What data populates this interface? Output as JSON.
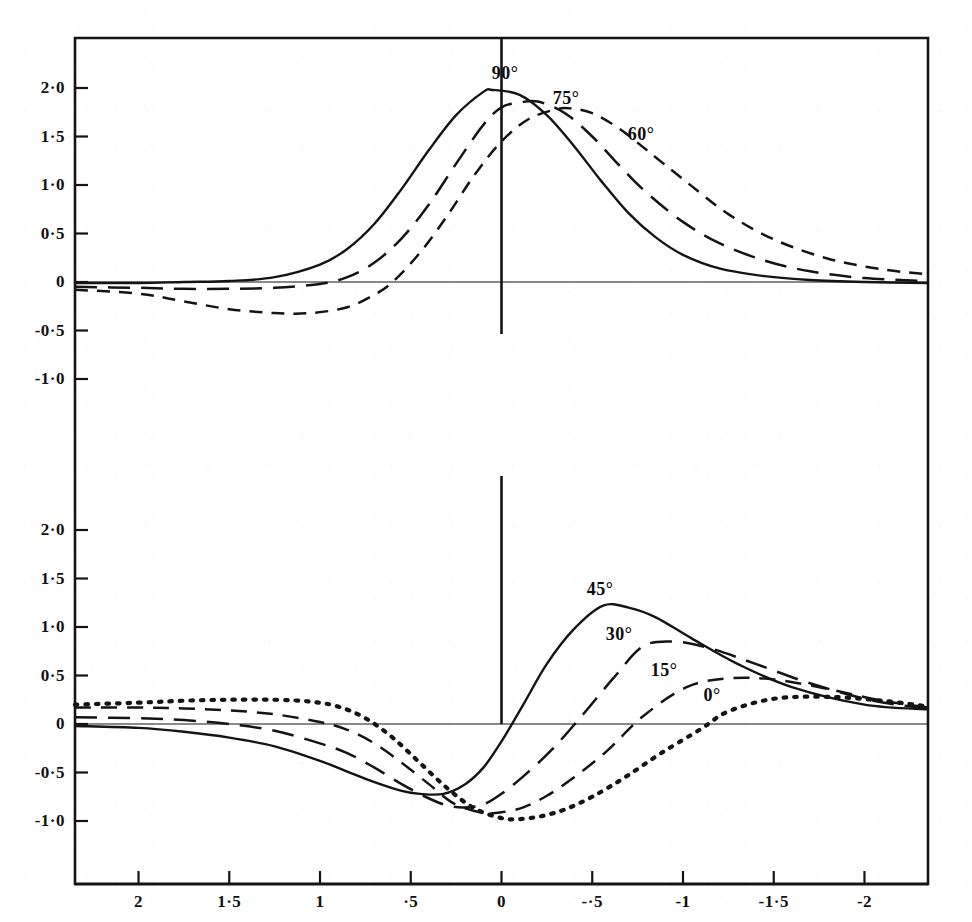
{
  "chart_data": {
    "type": "line",
    "title": "",
    "subtitle": "",
    "xlabel": "",
    "ylabel": "",
    "xlim": [
      2.35,
      -2.35
    ],
    "x_axis_reversed": true,
    "grid": false,
    "legend_position": "inline-curve-labels",
    "panels": [
      {
        "name": "upper-panel",
        "ylim": [
          -1.4,
          2.35
        ],
        "ytick_values": [
          2.0,
          1.5,
          1.0,
          0.5,
          0,
          -0.5,
          -1.0
        ],
        "ytick_labels": [
          "2·0",
          "1·5",
          "1·0",
          "0·5",
          "0",
          "-0·5",
          "-1·0"
        ],
        "zero_line": true,
        "vertical_axis_at_x": 0,
        "series": [
          {
            "name": "90°",
            "label": "90°",
            "style": "solid",
            "peak_x": 0.05,
            "peak_y": 1.98,
            "x": [
              2.35,
              2.0,
              1.75,
              1.5,
              1.25,
              1.0,
              0.85,
              0.7,
              0.55,
              0.4,
              0.25,
              0.1,
              0.05,
              -0.1,
              -0.25,
              -0.4,
              -0.55,
              -0.7,
              -0.85,
              -1.0,
              -1.2,
              -1.45,
              -1.7,
              -2.0,
              -2.35
            ],
            "y": [
              -0.01,
              -0.01,
              0.0,
              0.01,
              0.05,
              0.18,
              0.34,
              0.6,
              0.96,
              1.36,
              1.72,
              1.96,
              1.98,
              1.93,
              1.72,
              1.4,
              1.04,
              0.71,
              0.46,
              0.28,
              0.14,
              0.06,
              0.02,
              0.0,
              -0.01
            ]
          },
          {
            "name": "75°",
            "label": "75°",
            "style": "long-dash",
            "peak_x": -0.2,
            "peak_y": 1.86,
            "x": [
              2.35,
              2.0,
              1.75,
              1.5,
              1.25,
              1.0,
              0.85,
              0.7,
              0.55,
              0.4,
              0.25,
              0.1,
              0.0,
              -0.1,
              -0.2,
              -0.35,
              -0.5,
              -0.65,
              -0.8,
              -1.0,
              -1.2,
              -1.45,
              -1.7,
              -2.0,
              -2.35
            ],
            "y": [
              -0.05,
              -0.06,
              -0.07,
              -0.07,
              -0.06,
              -0.02,
              0.05,
              0.2,
              0.45,
              0.8,
              1.22,
              1.62,
              1.8,
              1.85,
              1.86,
              1.74,
              1.5,
              1.2,
              0.92,
              0.62,
              0.4,
              0.22,
              0.11,
              0.04,
              0.01
            ]
          },
          {
            "name": "60°",
            "label": "60°",
            "style": "short-dash",
            "peak_x": -0.38,
            "peak_y": 1.79,
            "x": [
              2.35,
              2.0,
              1.75,
              1.5,
              1.25,
              1.05,
              0.85,
              0.7,
              0.6,
              0.45,
              0.3,
              0.15,
              0.0,
              -0.15,
              -0.3,
              -0.38,
              -0.5,
              -0.65,
              -0.8,
              -1.0,
              -1.25,
              -1.5,
              -1.8,
              -2.1,
              -2.35
            ],
            "y": [
              -0.08,
              -0.12,
              -0.2,
              -0.28,
              -0.32,
              -0.32,
              -0.26,
              -0.13,
              0.0,
              0.3,
              0.68,
              1.1,
              1.45,
              1.68,
              1.78,
              1.79,
              1.74,
              1.58,
              1.36,
              1.06,
              0.7,
              0.44,
              0.24,
              0.13,
              0.08
            ]
          }
        ]
      },
      {
        "name": "lower-panel",
        "ylim": [
          -1.4,
          2.35
        ],
        "ytick_values": [
          2.0,
          1.5,
          1.0,
          0.5,
          0,
          -0.5,
          -1.0
        ],
        "ytick_labels": [
          "2·0",
          "1·5",
          "1·0",
          "0·5",
          "0",
          "-0·5",
          "-1·0"
        ],
        "zero_line": true,
        "vertical_axis_at_x": 0,
        "series": [
          {
            "name": "45°",
            "label": "45°",
            "style": "solid",
            "peak_x": -0.56,
            "peak_y": 1.22,
            "min_x": 0.32,
            "min_y": -0.72,
            "x": [
              2.35,
              2.0,
              1.75,
              1.5,
              1.25,
              1.0,
              0.85,
              0.7,
              0.55,
              0.45,
              0.32,
              0.2,
              0.1,
              0.0,
              -0.12,
              -0.25,
              -0.4,
              -0.56,
              -0.7,
              -0.85,
              -1.05,
              -1.3,
              -1.6,
              -2.0,
              -2.35
            ],
            "y": [
              -0.02,
              -0.04,
              -0.08,
              -0.14,
              -0.23,
              -0.38,
              -0.49,
              -0.6,
              -0.69,
              -0.72,
              -0.72,
              -0.62,
              -0.45,
              -0.18,
              0.2,
              0.62,
              0.98,
              1.22,
              1.2,
              1.1,
              0.88,
              0.62,
              0.38,
              0.2,
              0.15
            ]
          },
          {
            "name": "30°",
            "label": "30°",
            "style": "long-dash",
            "peak_x": -0.78,
            "peak_y": 0.85,
            "min_x": 0.2,
            "min_y": -0.86,
            "x": [
              2.35,
              2.0,
              1.75,
              1.5,
              1.25,
              1.0,
              0.85,
              0.7,
              0.55,
              0.42,
              0.3,
              0.2,
              0.1,
              0.0,
              -0.12,
              -0.28,
              -0.45,
              -0.62,
              -0.78,
              -0.95,
              -1.15,
              -1.4,
              -1.7,
              -2.05,
              -2.35
            ],
            "y": [
              0.07,
              0.06,
              0.04,
              0.0,
              -0.07,
              -0.2,
              -0.3,
              -0.45,
              -0.62,
              -0.75,
              -0.84,
              -0.86,
              -0.83,
              -0.72,
              -0.54,
              -0.26,
              0.1,
              0.48,
              0.8,
              0.85,
              0.78,
              0.62,
              0.42,
              0.24,
              0.16
            ]
          },
          {
            "name": "15°",
            "label": "15°",
            "style": "dashed",
            "peak_x": -1.02,
            "peak_y": 0.47,
            "min_x": 0.08,
            "min_y": -0.92,
            "x": [
              2.35,
              2.0,
              1.75,
              1.5,
              1.25,
              1.0,
              0.85,
              0.7,
              0.55,
              0.4,
              0.28,
              0.18,
              0.08,
              0.0,
              -0.12,
              -0.25,
              -0.4,
              -0.58,
              -0.78,
              -1.02,
              -1.25,
              -1.5,
              -1.8,
              -2.1,
              -2.35
            ],
            "y": [
              0.17,
              0.17,
              0.16,
              0.14,
              0.1,
              0.02,
              -0.06,
              -0.2,
              -0.4,
              -0.62,
              -0.8,
              -0.88,
              -0.92,
              -0.91,
              -0.86,
              -0.74,
              -0.55,
              -0.28,
              0.08,
              0.38,
              0.47,
              0.46,
              0.36,
              0.24,
              0.17
            ]
          },
          {
            "name": "0°",
            "label": "0°",
            "style": "dotted",
            "peak_x": -1.25,
            "peak_y": 0.28,
            "min_x": -0.1,
            "min_y": -0.98,
            "x": [
              2.35,
              2.0,
              1.75,
              1.5,
              1.25,
              1.05,
              0.9,
              0.75,
              0.6,
              0.45,
              0.3,
              0.15,
              0.0,
              -0.1,
              -0.22,
              -0.35,
              -0.5,
              -0.68,
              -0.88,
              -1.1,
              -1.25,
              -1.5,
              -1.8,
              -2.1,
              -2.35
            ],
            "y": [
              0.2,
              0.22,
              0.24,
              0.25,
              0.25,
              0.23,
              0.18,
              0.06,
              -0.14,
              -0.4,
              -0.66,
              -0.87,
              -0.97,
              -0.98,
              -0.95,
              -0.88,
              -0.75,
              -0.55,
              -0.3,
              -0.05,
              0.13,
              0.26,
              0.28,
              0.24,
              0.18
            ]
          }
        ]
      }
    ],
    "xtick_values": [
      2,
      1.5,
      1,
      0.5,
      0,
      -0.5,
      -1,
      -1.5,
      -2
    ],
    "xtick_labels": [
      "2",
      "1·5",
      "1",
      "·5",
      "0",
      "-·5",
      "-1",
      "-1·5",
      "-2"
    ],
    "ink_color": "#141414",
    "background_color": "#ffffff"
  }
}
